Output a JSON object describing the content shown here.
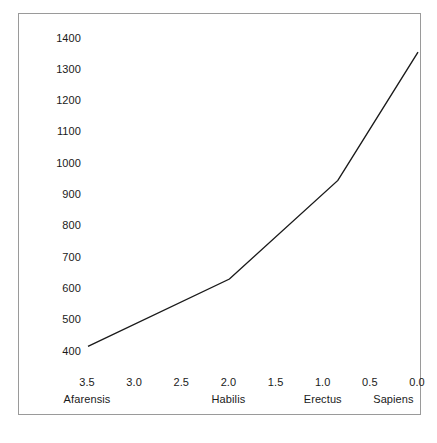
{
  "chart_data": {
    "type": "line",
    "title": "",
    "subtitle": "",
    "xlabel": "",
    "ylabel": "",
    "grid": false,
    "legend": false,
    "x_axis_reversed": true,
    "xlim": [
      3.75,
      -0.15
    ],
    "ylim": [
      370,
      1440
    ],
    "x_tick_labels": [
      "3.5",
      "3.0",
      "2.5",
      "2.0",
      "1.5",
      "1.0",
      "0.5",
      "0.0"
    ],
    "x_tick_values": [
      3.5,
      3.0,
      2.5,
      2.0,
      1.5,
      1.0,
      0.5,
      0.0
    ],
    "y_tick_labels": [
      "1400",
      "1300",
      "1200",
      "1100",
      "1000",
      "900",
      "800",
      "700",
      "600",
      "500",
      "400"
    ],
    "y_tick_values": [
      1400,
      1300,
      1200,
      1100,
      1000,
      900,
      800,
      700,
      600,
      500,
      400
    ],
    "category_labels": [
      {
        "label": "Afarensis",
        "x": 3.5
      },
      {
        "label": "Habilis",
        "x": 2.0
      },
      {
        "label": "Erectus",
        "x": 1.0
      },
      {
        "label": "Sapiens",
        "x": 0.25
      }
    ],
    "series": [
      {
        "name": "Cranial capacity",
        "color": "#1a1a1a",
        "x": [
          3.5,
          2.0,
          0.85,
          0.0
        ],
        "values": [
          415,
          630,
          945,
          1355
        ]
      }
    ]
  },
  "figure": {
    "frame_color": "#9a9a9a",
    "background": "#ffffff",
    "line_color": "#1a1a1a",
    "text_color": "#1a1a1a"
  }
}
